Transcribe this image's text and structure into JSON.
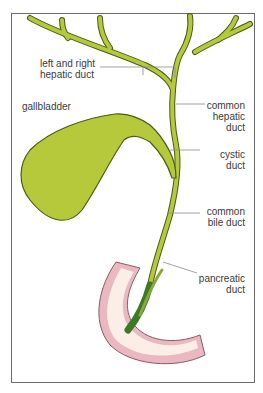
{
  "diagram": {
    "type": "anatomical illustration",
    "colors": {
      "duct_fill": "#b5c93a",
      "duct_outline": "#4b5a1a",
      "pancreatic_duct_dark": "#3c7a28",
      "duodenum_wall": "#e9b8c0",
      "duodenum_inner": "#fbeee6",
      "leader_line": "#8a8a8a",
      "frame": "#6b6b6b"
    },
    "labels": {
      "hepatic_left_right_1": "left and right",
      "hepatic_left_right_2": "hepatic duct",
      "gallbladder": "gallbladder",
      "common_hepatic_1": "common",
      "common_hepatic_2": "hepatic",
      "common_hepatic_3": "duct",
      "cystic_1": "cystic",
      "cystic_2": "duct",
      "common_bile_1": "common",
      "common_bile_2": "bile duct",
      "pancreatic_1": "pancreatic",
      "pancreatic_2": "duct"
    }
  }
}
